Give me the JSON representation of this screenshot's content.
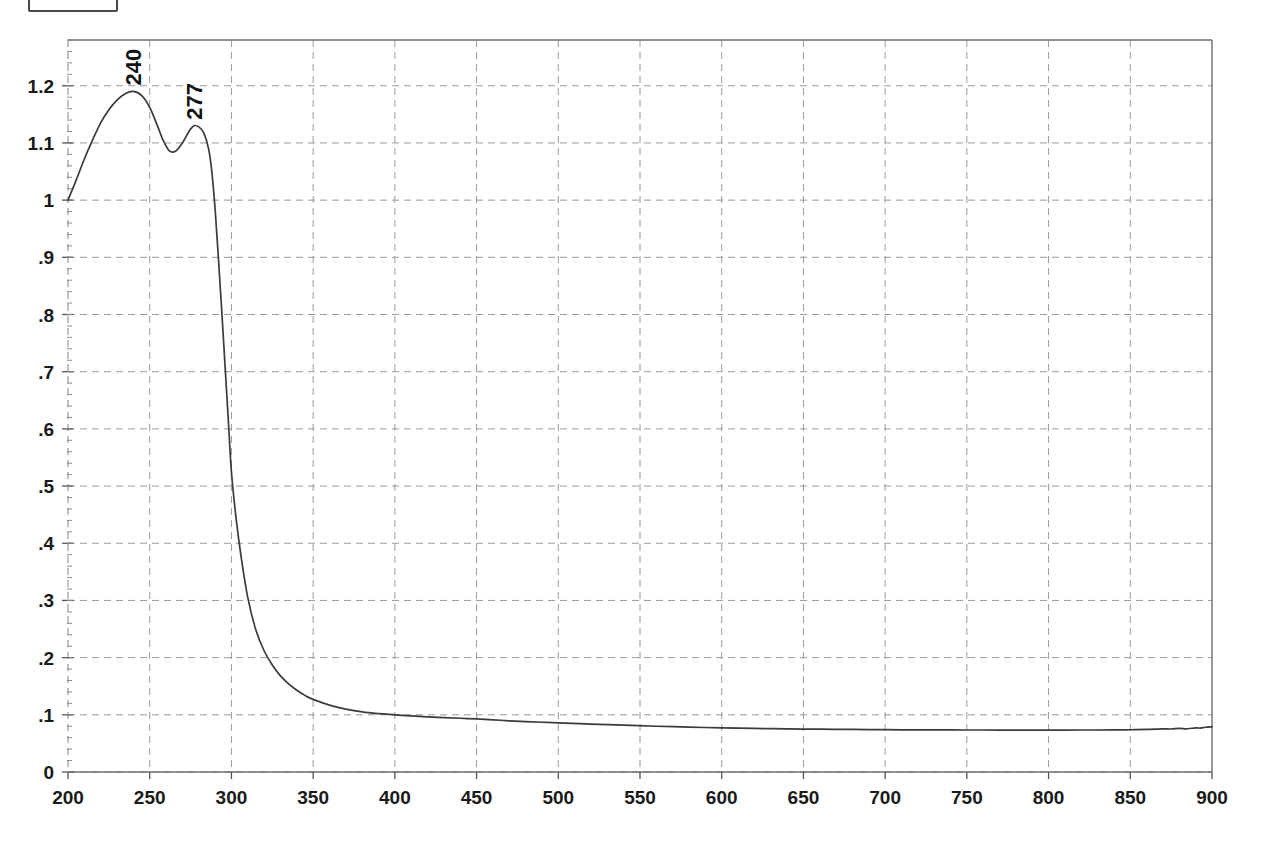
{
  "page": {
    "background_color": "#ffffff",
    "ink_color": "#3b3b3b",
    "grid_color": "#9a9a9a",
    "artifact_label": "scan-edge-box"
  },
  "chart_data": {
    "type": "line",
    "title": "",
    "subtitle": "",
    "xlabel": "",
    "ylabel": "",
    "xlim": [
      200,
      900
    ],
    "ylim": [
      0,
      1.28
    ],
    "grid": true,
    "legend": null,
    "x_ticks": [
      200,
      250,
      300,
      350,
      400,
      450,
      500,
      550,
      600,
      650,
      700,
      750,
      800,
      850,
      900
    ],
    "x_tick_labels": [
      "200",
      "250",
      "300",
      "350",
      "400",
      "450",
      "500",
      "550",
      "600",
      "650",
      "700",
      "750",
      "800",
      "850",
      "900"
    ],
    "y_ticks": [
      0,
      0.1,
      0.2,
      0.3,
      0.4,
      0.5,
      0.6,
      0.7,
      0.8,
      0.9,
      1.0,
      1.1,
      1.2
    ],
    "y_tick_labels": [
      "0",
      ".1",
      ".2",
      ".3",
      ".4",
      ".5",
      ".6",
      ".7",
      ".8",
      ".9",
      "1",
      "1.1",
      "1.2"
    ],
    "annotations": [
      {
        "text": "240",
        "x": 240,
        "y": 1.19,
        "rotation": -90
      },
      {
        "text": "277",
        "x": 277,
        "y": 1.13,
        "rotation": -90
      }
    ],
    "series": [
      {
        "name": "absorbance",
        "x": [
          200,
          205,
          210,
          215,
          220,
          225,
          230,
          235,
          240,
          245,
          250,
          255,
          258,
          262,
          266,
          270,
          274,
          277,
          280,
          283,
          286,
          288,
          290,
          292,
          294,
          296,
          298,
          300,
          303,
          306,
          310,
          315,
          320,
          325,
          330,
          335,
          340,
          345,
          350,
          360,
          370,
          380,
          390,
          400,
          410,
          420,
          430,
          440,
          450,
          460,
          470,
          480,
          490,
          500,
          520,
          540,
          560,
          580,
          600,
          620,
          640,
          660,
          680,
          700,
          720,
          740,
          760,
          780,
          800,
          820,
          840,
          850,
          860,
          865,
          870,
          875,
          880,
          885,
          890,
          893,
          896,
          900
        ],
        "y": [
          1.0,
          1.035,
          1.072,
          1.105,
          1.135,
          1.158,
          1.175,
          1.186,
          1.19,
          1.183,
          1.162,
          1.128,
          1.106,
          1.086,
          1.086,
          1.1,
          1.12,
          1.13,
          1.128,
          1.118,
          1.09,
          1.05,
          0.985,
          0.9,
          0.81,
          0.715,
          0.62,
          0.525,
          0.44,
          0.375,
          0.305,
          0.248,
          0.212,
          0.187,
          0.168,
          0.154,
          0.143,
          0.134,
          0.127,
          0.117,
          0.11,
          0.105,
          0.102,
          0.1,
          0.098,
          0.0965,
          0.0952,
          0.094,
          0.0928,
          0.0912,
          0.0895,
          0.0882,
          0.087,
          0.0858,
          0.0838,
          0.0818,
          0.08,
          0.0785,
          0.0772,
          0.0762,
          0.0754,
          0.0748,
          0.0744,
          0.074,
          0.0737,
          0.0735,
          0.0734,
          0.0733,
          0.0733,
          0.0734,
          0.0736,
          0.0739,
          0.0744,
          0.0748,
          0.0754,
          0.0752,
          0.0762,
          0.0756,
          0.0772,
          0.0768,
          0.0782,
          0.079
        ]
      }
    ]
  }
}
